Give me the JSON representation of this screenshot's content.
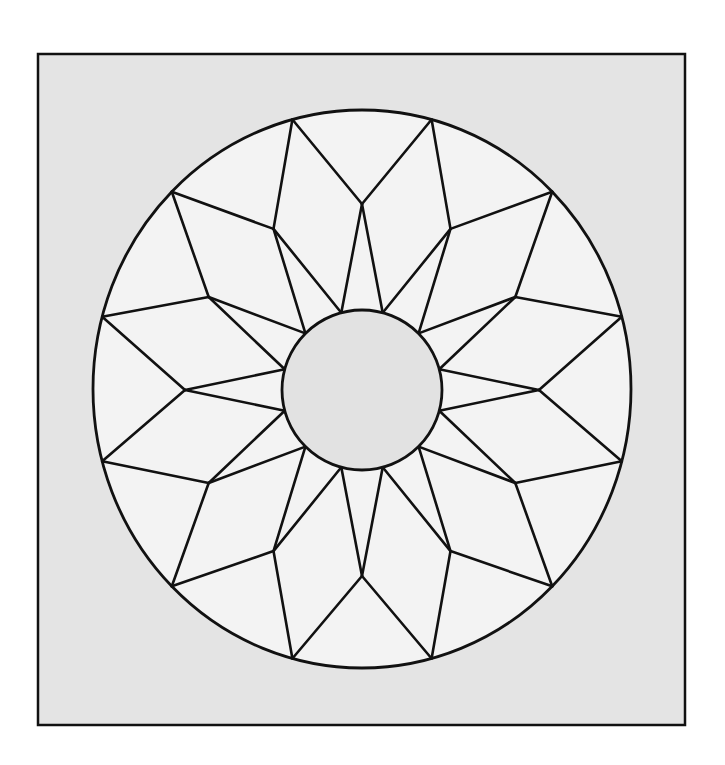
{
  "diagram": {
    "type": "twelve-point star quilt block (carpenter's wheel / lone star)",
    "points": 12,
    "canvas": {
      "width": 725,
      "height": 765,
      "background": "#ffffff"
    },
    "frame": {
      "x": 38,
      "y": 54,
      "width": 647,
      "height": 671,
      "fill": "#e4e4e4",
      "stroke": "#111111",
      "stroke_width": 2.5
    },
    "outer_circle": {
      "cx": 362,
      "cy": 389,
      "rx": 269,
      "ry": 279,
      "fill": "#f3f3f3",
      "stroke": "#111111",
      "stroke_width": 2.8
    },
    "middle_ring": {
      "rx": 177,
      "ry": 186,
      "angle_offset_deg": 0
    },
    "outer_vertex_angle_offset_deg": 15,
    "inner_circle": {
      "cx": 362,
      "cy": 390,
      "r": 80,
      "fill": "#e2e2e2",
      "stroke": "#111111",
      "stroke_width": 2.8
    },
    "line": {
      "stroke": "#111111",
      "stroke_width": 2.6
    }
  }
}
